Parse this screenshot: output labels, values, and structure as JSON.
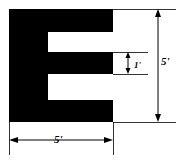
{
  "figure": {
    "shape_fill": "#000000",
    "background": "#ffffff",
    "line_color": "#000000",
    "outline": {
      "name": "e-shaped-polygon",
      "description": "Filled black E-shaped region, 5 feet wide by 5 feet tall, with two square notches cut from the right side and a central arm 1 foot thick.",
      "points": "9,9 113,9 113,32 48,32 48,52 113,52 113,74 48,74 48,100 113,100 113,122 9,122"
    },
    "dimensions": [
      {
        "name": "overall-width",
        "label": "5'",
        "value": 5,
        "unit": "ft",
        "orientation": "horizontal",
        "from": 10,
        "to": 113,
        "at": 140
      },
      {
        "name": "overall-height",
        "label": "5'",
        "value": 5,
        "unit": "ft",
        "orientation": "vertical",
        "from": 10,
        "to": 122,
        "at": 158
      },
      {
        "name": "arm-thickness",
        "label": "1'",
        "value": 1,
        "unit": "ft",
        "orientation": "vertical",
        "from": 52,
        "to": 74,
        "at": 128
      }
    ],
    "extension_lines": [
      {
        "name": "top-extension-line",
        "x1": 113,
        "y1": 9,
        "x2": 176,
        "y2": 9
      },
      {
        "name": "bottom-extension-line",
        "x1": 113,
        "y1": 122,
        "x2": 176,
        "y2": 122
      },
      {
        "name": "left-extension-line",
        "x1": 9,
        "y1": 122,
        "x2": 9,
        "y2": 155
      },
      {
        "name": "right-extension-line",
        "x1": 113,
        "y1": 122,
        "x2": 113,
        "y2": 155
      },
      {
        "name": "notch-top-extension-line",
        "x1": 113,
        "y1": 52,
        "x2": 148,
        "y2": 52
      },
      {
        "name": "notch-bottom-extension-line",
        "x1": 113,
        "y1": 74,
        "x2": 148,
        "y2": 74
      }
    ]
  }
}
